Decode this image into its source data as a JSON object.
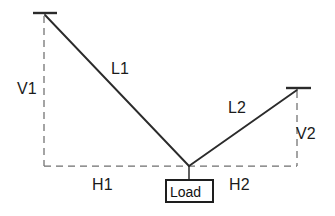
{
  "diagram": {
    "type": "two-cable-suspended-load-free-body-diagram",
    "canvas": {
      "width": 335,
      "height": 216,
      "background": "#ffffff"
    },
    "colors": {
      "member_stroke": "#2b2b2b",
      "dimension_stroke": "#6f6f6f",
      "text": "#1b1b1b",
      "box_fill": "#ffffff",
      "box_stroke": "#1e1e1e"
    },
    "nodes": {
      "left_anchor": {
        "name": "left-anchor",
        "x": 45,
        "y": 15
      },
      "right_anchor": {
        "name": "right-anchor",
        "x": 297,
        "y": 90
      },
      "junction": {
        "name": "load-junction",
        "x": 189,
        "y": 166
      },
      "load_attach": {
        "name": "load-attachment",
        "x": 189,
        "y": 180
      }
    },
    "members": [
      {
        "name": "cable-l1",
        "label": "L1",
        "from": "left_anchor",
        "to": "junction"
      },
      {
        "name": "cable-l2",
        "label": "L2",
        "from": "right_anchor",
        "to": "junction"
      }
    ],
    "supports": [
      {
        "name": "left-support-bar",
        "x1": 33,
        "x2": 57,
        "y": 13
      },
      {
        "name": "right-support-bar",
        "x1": 286,
        "x2": 311,
        "y": 88
      }
    ],
    "dimensions": [
      {
        "name": "vertical-dimension-v1",
        "label": "V1",
        "orientation": "vertical",
        "x": 44,
        "y1": 16,
        "y2": 166
      },
      {
        "name": "horizontal-dimension-h1",
        "label": "H1",
        "orientation": "horizontal",
        "y": 166,
        "x1": 44,
        "x2": 189
      },
      {
        "name": "horizontal-dimension-h2",
        "label": "H2",
        "orientation": "horizontal",
        "y": 166,
        "x1": 189,
        "x2": 297
      },
      {
        "name": "vertical-dimension-v2",
        "label": "V2",
        "orientation": "vertical",
        "x": 297,
        "y1": 91,
        "y2": 166
      }
    ],
    "labels": {
      "v1": "V1",
      "l1": "L1",
      "l2": "L2",
      "v2": "V2",
      "h1": "H1",
      "h2": "H2"
    },
    "load": {
      "name": "load-box",
      "text": "Load",
      "box": {
        "x": 166,
        "y": 180,
        "width": 47,
        "height": 22
      },
      "connector": {
        "x": 189,
        "y1": 166,
        "y2": 180
      }
    }
  }
}
